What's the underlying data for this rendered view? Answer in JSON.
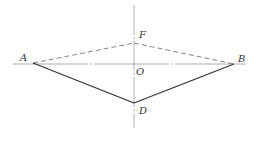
{
  "diagram": {
    "points": {
      "A": {
        "label": "A",
        "x": 33,
        "y": 63
      },
      "B": {
        "label": "B",
        "x": 234,
        "y": 64
      },
      "O": {
        "label": "O",
        "x": 134,
        "y": 64
      },
      "F": {
        "label": "F",
        "x": 134,
        "y": 43
      },
      "D": {
        "label": "D",
        "x": 134,
        "y": 103
      }
    },
    "colors": {
      "solid": "#333333",
      "dashed": "#777777",
      "axis": "#999999"
    }
  }
}
